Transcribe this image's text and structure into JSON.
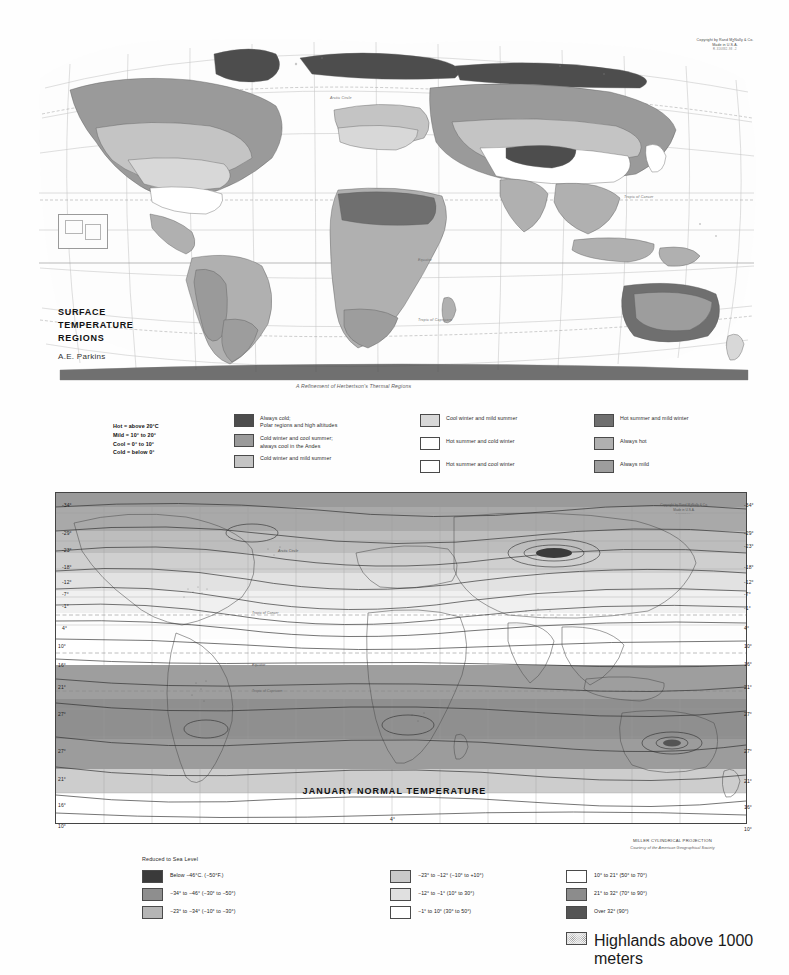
{
  "top_map": {
    "title_line1": "SURFACE",
    "title_line2": "TEMPERATURE",
    "title_line3": "REGIONS",
    "author": "A.E. Parkins",
    "subtitle": "A Refinement of Herbertson's Thermal Regions",
    "copyright_line1": "Copyright by Rand MᶚNally & Co.",
    "copyright_line2": "Made in U.S.A.",
    "copyright_line3": "R-316882-98        -2",
    "tropic_cancer": "Tropic of Cancer",
    "tropic_capricorn": "Tropic of Capricorn",
    "arctic_circle": "Arctic Circle",
    "equator": "Equator"
  },
  "top_legend": {
    "definitions": [
      "Hot = above 20°C",
      "Mild = 10° to 20°",
      "Cool = 0° to 10°",
      "Cold = below 0°"
    ],
    "column1": [
      {
        "label": "Always cold;\nPolar regions and high altitudes",
        "color": "#4d4d4d"
      },
      {
        "label": "Cold winter and cool summer;\nalways cool in the Andes",
        "color": "#9a9a9a"
      },
      {
        "label": "Cold winter and mild summer",
        "color": "#c4c4c4"
      }
    ],
    "column2": [
      {
        "label": "Cool winter and mild summer",
        "color": "#d8d8d8"
      },
      {
        "label": "Hot summer and cold winter",
        "color": "#ffffff"
      },
      {
        "label": "Hot summer and cool winter",
        "color": "#ffffff"
      }
    ],
    "column3": [
      {
        "label": "Hot summer and mild winter",
        "color": "#6f6f6f"
      },
      {
        "label": "Always hot",
        "color": "#b0b0b0"
      },
      {
        "label": "Always mild",
        "color": "#9d9d9d"
      }
    ]
  },
  "bottom_map": {
    "title": "JANUARY NORMAL TEMPERATURE",
    "projection": "MILLER CYLINDRICAL PROJECTION",
    "courtesy": "Courtesy of the American Geographical Society",
    "copyright_line1": "Copyright by Rand MᶚNally & Co.",
    "copyright_line2": "Made in U.S.A.",
    "copyright_line3": "R-316883  8-6-A",
    "isotherm_labels_left": [
      "-34°",
      "-29°",
      "-23°",
      "-18°",
      "-12°",
      "-7°",
      "-1°",
      "4°",
      "10°",
      "16°",
      "21°",
      "27°",
      "27°",
      "21°",
      "16°",
      "10°"
    ],
    "isotherm_labels_right": [
      "-34°",
      "-29°",
      "-23°",
      "-18°",
      "-12°",
      "-7°",
      "-1°",
      "4°",
      "10°",
      "16°",
      "21°",
      "27°",
      "27°",
      "21°",
      "16°",
      "10°"
    ],
    "lat_ticks_left": [
      "60",
      "50",
      "40",
      "30",
      "20",
      "10",
      "0",
      "10",
      "20",
      "30",
      "40",
      "50"
    ],
    "lat_ticks_right": [
      "60",
      "50",
      "40",
      "30",
      "20",
      "10",
      "0",
      "10",
      "20",
      "30",
      "40",
      "50"
    ],
    "tropic_cancer": "Tropic of Cancer",
    "tropic_capricorn": "Tropic of Capricorn",
    "equator": "Equator",
    "arctic_circle": "Arctic Circle",
    "bottom_edge_value": "4°"
  },
  "bottom_legend": {
    "heading": "Reduced to Sea Level",
    "column1": [
      {
        "label": "Below −46°C.  (−50°F.)",
        "color": "#3a3a3a"
      },
      {
        "label": "−34° to −46°   (−30° to −50°)",
        "color": "#8e8e8e"
      },
      {
        "label": "−23° to −34°   (−10° to −30°)",
        "color": "#b5b5b5"
      }
    ],
    "column2": [
      {
        "label": "−23° to −12°   (−10° to +10°)",
        "color": "#c9c9c9"
      },
      {
        "label": "−12° to −1°    (10° to 30°)",
        "color": "#e0e0e0"
      },
      {
        "label": "−1° to 10°   (30° to 50°)",
        "color": "#ffffff"
      }
    ],
    "column3": [
      {
        "label": "10° to 21°    (50° to 70°)",
        "color": "#ffffff"
      },
      {
        "label": "21° to 32°    (70° to 90°)",
        "color": "#8c8c8c"
      },
      {
        "label": "Over 32°   (90°)",
        "color": "#545454"
      }
    ],
    "highlands": {
      "label": "Highlands above 1000 meters",
      "color": "#efefef"
    }
  }
}
